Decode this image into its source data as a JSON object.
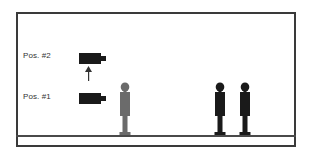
{
  "diagram": {
    "labels": {
      "pos2": "Pos. #2",
      "pos1": "Pos. #1"
    },
    "elements": {
      "cameras": [
        {
          "name": "camera-position-2",
          "label": "Pos. #2",
          "color": "#1a1a1a"
        },
        {
          "name": "camera-position-1",
          "label": "Pos. #1",
          "color": "#1a1a1a"
        }
      ],
      "arrow": {
        "direction": "up",
        "from": "Pos. #1",
        "to": "Pos. #2",
        "color": "#333333"
      },
      "people": [
        {
          "name": "person-gray",
          "color": "#6b6b6b"
        },
        {
          "name": "person-black-1",
          "color": "#1a1a1a"
        },
        {
          "name": "person-black-2",
          "color": "#1a1a1a"
        }
      ]
    },
    "colors": {
      "frame": "#3a3a3a",
      "ground": "#4a4a4a",
      "background": "#ffffff"
    }
  }
}
